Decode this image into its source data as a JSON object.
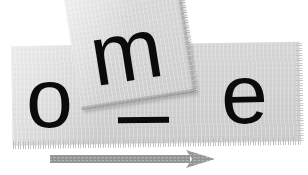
{
  "canvas": {
    "width": 308,
    "height": 175,
    "background_color": "#ffffff"
  },
  "composition": {
    "title": "Torn paper letter fragments spelling a partial word",
    "description": "Three black lowercase letters on light gray paper pieces with a gray arrow beneath",
    "word_fragment": "om_e"
  },
  "paper_strip": {
    "label": "main-paper-strip",
    "fill_color": "#d1d1d1",
    "edge_style": "frayed",
    "rotation_deg": -0.9
  },
  "paper_scrap": {
    "label": "rotated-paper-scrap",
    "fill_color": "#d5d5d5",
    "edge_style": "shadowed-torn",
    "rotation_deg": -9
  },
  "letters": [
    {
      "character": "o",
      "name": "letter-o",
      "color": "#0b0b0b",
      "surface": "main-paper-strip",
      "rotation_deg": -1
    },
    {
      "character": "m",
      "name": "letter-m",
      "color": "#0b0b0b",
      "surface": "rotated-paper-scrap",
      "rotation_deg": -9
    },
    {
      "character": "e",
      "name": "letter-e",
      "color": "#0b0b0b",
      "surface": "main-paper-strip",
      "rotation_deg": -1
    }
  ],
  "underscore": {
    "character": "_",
    "name": "underscore-mark",
    "color": "#0b0b0b"
  },
  "arrow": {
    "name": "direction-arrow",
    "direction": "right",
    "color": "#9a9a9a",
    "style": "dashed-texture"
  }
}
